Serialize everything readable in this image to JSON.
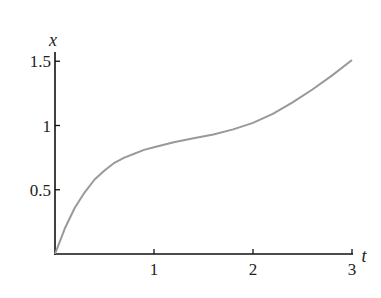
{
  "chart_data": {
    "type": "line",
    "title": "",
    "xlabel": "t",
    "ylabel": "x",
    "xlim": [
      0,
      3
    ],
    "ylim": [
      0,
      1.5
    ],
    "grid": false,
    "legend": null,
    "x_ticks": [
      "1",
      "2",
      "3"
    ],
    "y_ticks": [
      "0.5",
      "1",
      "1.5"
    ],
    "series": [
      {
        "name": "x(t)",
        "color": "#999999",
        "x": [
          0,
          0.1,
          0.2,
          0.3,
          0.4,
          0.5,
          0.6,
          0.7,
          0.8,
          0.9,
          1.0,
          1.2,
          1.4,
          1.6,
          1.8,
          2.0,
          2.2,
          2.4,
          2.6,
          2.8,
          3.0
        ],
        "y": [
          0.0,
          0.2,
          0.36,
          0.48,
          0.58,
          0.65,
          0.71,
          0.75,
          0.78,
          0.81,
          0.83,
          0.87,
          0.9,
          0.93,
          0.97,
          1.02,
          1.09,
          1.18,
          1.28,
          1.39,
          1.51
        ]
      }
    ]
  }
}
